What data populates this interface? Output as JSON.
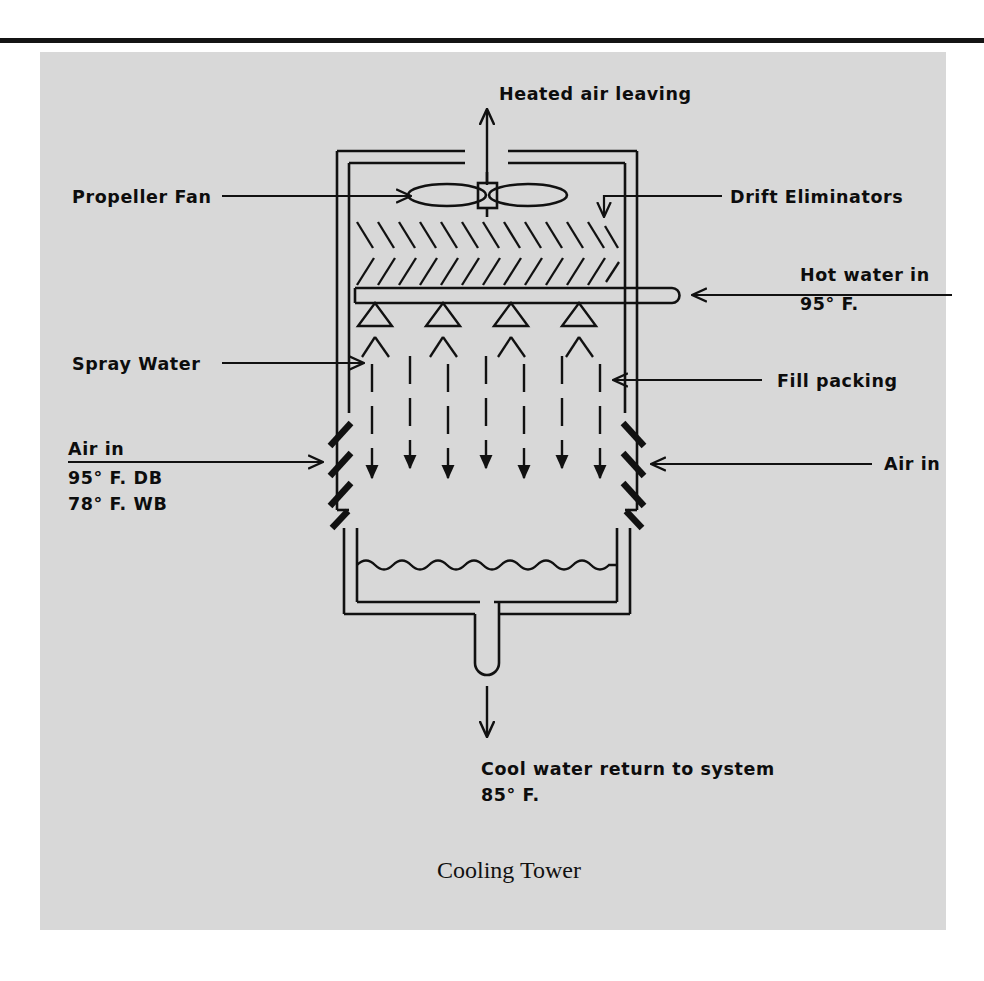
{
  "figure": {
    "caption": "Cooling Tower",
    "panel_color": "#d8d8d8",
    "ink_color": "#111111"
  },
  "labels": {
    "heated_air": "Heated air leaving",
    "propeller_fan": "Propeller Fan",
    "drift_eliminators": "Drift Eliminators",
    "hot_water_in": "Hot water in",
    "hot_water_temp": "95° F.",
    "spray_water": "Spray Water",
    "fill_packing": "Fill packing",
    "air_in_left": "Air in",
    "air_in_left_db": "95° F. DB",
    "air_in_left_wb": "78° F. WB",
    "air_in_right": "Air in",
    "cool_water_return": "Cool water return to system",
    "cool_water_temp": "85° F."
  },
  "components": {
    "fan": "propeller-fan",
    "drift_eliminator_rows": 2,
    "spray_nozzles": 4,
    "louver_bars_per_side": 4,
    "basin": "collection-basin",
    "drain": "drain-pipe"
  }
}
